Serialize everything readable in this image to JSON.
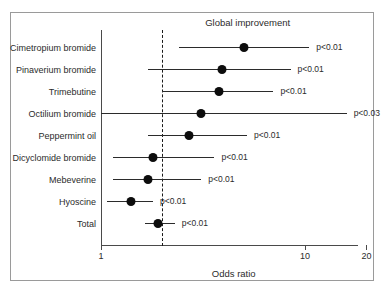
{
  "chart_data": {
    "type": "scatter",
    "subtype": "forest-plot",
    "title": "Global improvement",
    "xlabel": "Odds ratio",
    "ylabel": "",
    "xscale": "log",
    "xlim": [
      1,
      20
    ],
    "xticks": [
      1,
      10,
      20
    ],
    "xtick_labels": [
      "1",
      "10",
      "20"
    ],
    "grid": false,
    "legend": null,
    "reference_line": 2.0,
    "reference_line_style": "dashed",
    "categories": [
      "Cimetropium bromide",
      "Pinaverium bromide",
      "Trimebutine",
      "Octilium bromide",
      "Peppermint oil",
      "Dicyclomide bromide",
      "Mebeverine",
      "Hyoscine",
      "Total"
    ],
    "values": [
      5.0,
      3.9,
      3.8,
      3.1,
      2.7,
      1.8,
      1.7,
      1.4,
      1.9
    ],
    "ci_low": [
      2.4,
      1.7,
      2.0,
      1.0,
      1.7,
      1.15,
      1.15,
      1.07,
      1.65
    ],
    "ci_high": [
      10.5,
      8.5,
      7.0,
      16.0,
      5.2,
      3.6,
      3.1,
      1.8,
      2.3
    ],
    "annotations": [
      "p<0.01",
      "p<0.01",
      "p<0.01",
      "p<0.03",
      "p<0.01",
      "p<0.01",
      "p<0.01",
      "p<0.01",
      "p<0.01"
    ]
  },
  "rows": [
    {
      "label": "Cimetropium bromide",
      "or": 5.0,
      "lo": 2.4,
      "hi": 10.5,
      "p": "p<0.01"
    },
    {
      "label": "Pinaverium bromide",
      "or": 3.9,
      "lo": 1.7,
      "hi": 8.5,
      "p": "p<0.01"
    },
    {
      "label": "Trimebutine",
      "or": 3.8,
      "lo": 2.0,
      "hi": 7.0,
      "p": "p<0.01"
    },
    {
      "label": "Octilium bromide",
      "or": 3.1,
      "lo": 1.0,
      "hi": 16.0,
      "p": "p<0.03"
    },
    {
      "label": "Peppermint oil",
      "or": 2.7,
      "lo": 1.7,
      "hi": 5.2,
      "p": "p<0.01"
    },
    {
      "label": "Dicyclomide bromide",
      "or": 1.8,
      "lo": 1.15,
      "hi": 3.6,
      "p": "p<0.01"
    },
    {
      "label": "Mebeverine",
      "or": 1.7,
      "lo": 1.15,
      "hi": 3.1,
      "p": "p<0.01"
    },
    {
      "label": "Hyoscine",
      "or": 1.4,
      "lo": 1.07,
      "hi": 1.8,
      "p": "p<0.01"
    },
    {
      "label": "Total",
      "or": 1.9,
      "lo": 1.65,
      "hi": 2.3,
      "p": "p<0.01"
    }
  ],
  "axis": {
    "title": "Global improvement",
    "x_label": "Odds ratio",
    "ticks": [
      {
        "value": 1,
        "label": "1"
      },
      {
        "value": 10,
        "label": "10"
      },
      {
        "value": 20,
        "label": "20"
      }
    ],
    "null_value": 2.0
  },
  "colors": {
    "marker": "#0d0d0d",
    "line": "#2b2b2b",
    "axis": "#4a4a4a",
    "frame": "#9a9a9a",
    "text": "#2b2b2b",
    "background": "#ffffff"
  }
}
